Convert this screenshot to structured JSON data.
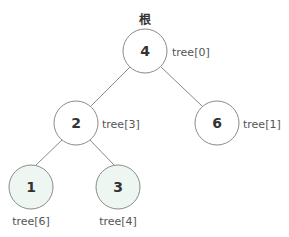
{
  "root_label": "根",
  "colors": {
    "edge": "#888888",
    "node_stroke": "#8a8a8a",
    "node_fill": "#ffffff",
    "leaf_fill": "#eef6f1",
    "text": "#333333",
    "index_text": "#555555"
  },
  "nodes": [
    {
      "value": "4",
      "index_label": "tree[0]",
      "highlighted": false
    },
    {
      "value": "2",
      "index_label": "tree[3]",
      "highlighted": false
    },
    {
      "value": "6",
      "index_label": "tree[1]",
      "highlighted": false
    },
    {
      "value": "1",
      "index_label": "tree[6]",
      "highlighted": true
    },
    {
      "value": "3",
      "index_label": "tree[4]",
      "highlighted": true
    }
  ],
  "edges": [
    {
      "from": "4",
      "to": "2"
    },
    {
      "from": "4",
      "to": "6"
    },
    {
      "from": "2",
      "to": "1"
    },
    {
      "from": "2",
      "to": "3"
    }
  ]
}
